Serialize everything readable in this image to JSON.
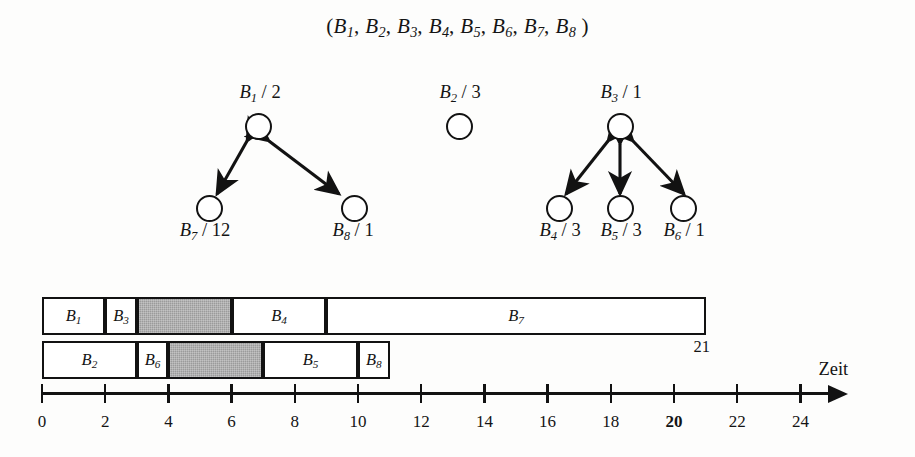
{
  "figure": {
    "tuple_text": "(B1, B2, B3, B4, B5, B6, B7, B8 )",
    "time_axis_title": "Zeit",
    "makespan_label": "21"
  },
  "task_graph": {
    "groups": [
      {
        "name": "group-b1",
        "root": {
          "id": "B1",
          "label_base": "B",
          "label_sub": "1",
          "priority": "2",
          "label": "B1 / 2"
        },
        "children": [
          {
            "id": "B7",
            "label_base": "B",
            "label_sub": "7",
            "priority": "12",
            "label": "B7 / 12"
          },
          {
            "id": "B8",
            "label_base": "B",
            "label_sub": "8",
            "priority": "1",
            "label": "B8 / 1"
          }
        ]
      },
      {
        "name": "group-b2",
        "root": {
          "id": "B2",
          "label_base": "B",
          "label_sub": "2",
          "priority": "3",
          "label": "B2 / 3"
        },
        "children": []
      },
      {
        "name": "group-b3",
        "root": {
          "id": "B3",
          "label_base": "B",
          "label_sub": "3",
          "priority": "1",
          "label": "B3 / 1"
        },
        "children": [
          {
            "id": "B4",
            "label_base": "B",
            "label_sub": "4",
            "priority": "3",
            "label": "B4 / 3"
          },
          {
            "id": "B5",
            "label_base": "B",
            "label_sub": "5",
            "priority": "3",
            "label": "B5 / 3"
          },
          {
            "id": "B6",
            "label_base": "B",
            "label_sub": "6",
            "priority": "1",
            "label": "B6 / 1"
          }
        ]
      }
    ]
  },
  "chart_data": {
    "type": "bar",
    "title": "",
    "xlabel": "Zeit",
    "ylabel": "",
    "xlim": [
      0,
      24
    ],
    "grid": false,
    "legend": "none",
    "orientation": "horizontal-gantt",
    "xticks": [
      0,
      2,
      4,
      6,
      8,
      10,
      12,
      14,
      16,
      18,
      20,
      22,
      24
    ],
    "xtick_labels": [
      "0",
      "2",
      "4",
      "6",
      "8",
      "10",
      "12",
      "14",
      "16",
      "18",
      "20",
      "22",
      "24"
    ],
    "bold_tick": "20",
    "annotations": [
      {
        "text": "21",
        "x": 21,
        "note": "end of processor-1 schedule"
      }
    ],
    "rows": [
      {
        "row": 1,
        "name": "processor-row-1",
        "blocks": [
          {
            "label": "B1",
            "base": "B",
            "sub": "1",
            "start": 0,
            "end": 2,
            "idle": false
          },
          {
            "label": "B3",
            "base": "B",
            "sub": "3",
            "start": 2,
            "end": 3,
            "idle": false
          },
          {
            "label": "",
            "base": "",
            "sub": "",
            "start": 3,
            "end": 6,
            "idle": true
          },
          {
            "label": "B4",
            "base": "B",
            "sub": "4",
            "start": 6,
            "end": 9,
            "idle": false
          },
          {
            "label": "B7",
            "base": "B",
            "sub": "7",
            "start": 9,
            "end": 21,
            "idle": false
          }
        ]
      },
      {
        "row": 2,
        "name": "processor-row-2",
        "blocks": [
          {
            "label": "B2",
            "base": "B",
            "sub": "2",
            "start": 0,
            "end": 3,
            "idle": false
          },
          {
            "label": "B6",
            "base": "B",
            "sub": "6",
            "start": 3,
            "end": 4,
            "idle": false
          },
          {
            "label": "",
            "base": "",
            "sub": "",
            "start": 4,
            "end": 7,
            "idle": true
          },
          {
            "label": "B5",
            "base": "B",
            "sub": "5",
            "start": 7,
            "end": 10,
            "idle": false
          },
          {
            "label": "B8",
            "base": "B",
            "sub": "8",
            "start": 10,
            "end": 11,
            "idle": false
          }
        ]
      }
    ]
  },
  "colors": {
    "ink": "#121212",
    "idle_fill": "#9b9b9b",
    "paper": "#fdfdfc"
  }
}
